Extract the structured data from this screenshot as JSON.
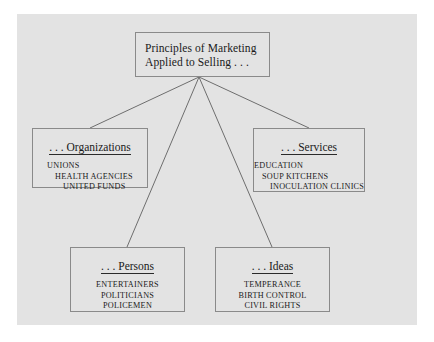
{
  "figure": {
    "root": {
      "title_line_1": "Principles of Marketing",
      "title_line_2": "Applied to Selling . . ."
    },
    "branches": [
      {
        "key": "organizations",
        "title": ". . . Organizations",
        "items": [
          "UNIONS",
          "HEALTH AGENCIES",
          "UNITED FUNDS"
        ]
      },
      {
        "key": "services",
        "title": ". . . Services",
        "items": [
          "EDUCATION",
          "SOUP KITCHENS",
          "INOCULATION CLINICS"
        ]
      },
      {
        "key": "persons",
        "title": ". . . Persons",
        "items": [
          "ENTERTAINERS",
          "POLITICIANS",
          "POLICEMEN"
        ]
      },
      {
        "key": "ideas",
        "title": ". . . Ideas",
        "items": [
          "TEMPERANCE",
          "BIRTH CONTROL",
          "CIVIL RIGHTS"
        ]
      }
    ],
    "colors": {
      "panel_background": "#e3e3e3",
      "page_background": "#ffffff",
      "box_border": "#8a8a8a",
      "connector_line": "#6e6e6e",
      "text": "#1a1a1a"
    }
  }
}
